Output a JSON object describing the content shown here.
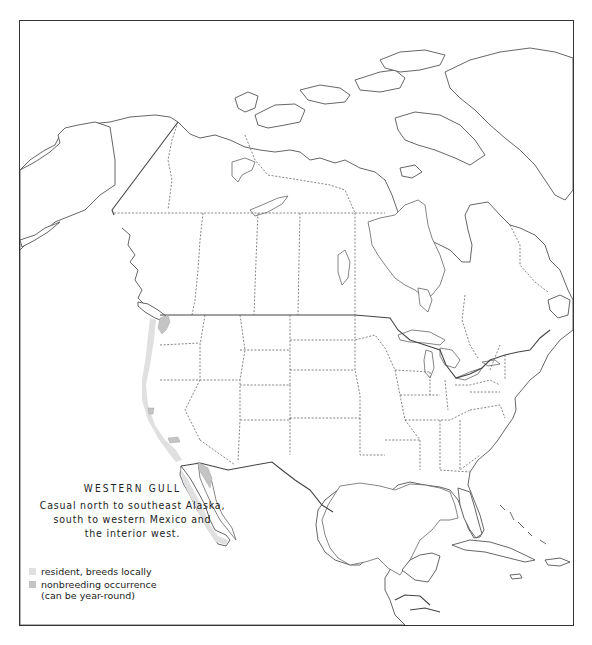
{
  "map": {
    "region": "North America",
    "species": "WESTERN GULL",
    "description_lines": [
      "Casual north to southeast Alaska,",
      "south to western Mexico and",
      "the interior west."
    ],
    "colors": {
      "resident": "#e0e0e0",
      "nonbreeding": "#c4c4c4",
      "outline": "#555555",
      "frame": "#333333"
    }
  },
  "legend": {
    "items": [
      {
        "key": "resident",
        "label": "resident, breeds locally"
      },
      {
        "key": "nonbreeding",
        "label": "nonbreeding occurrence\n(can be year-round)"
      }
    ]
  }
}
